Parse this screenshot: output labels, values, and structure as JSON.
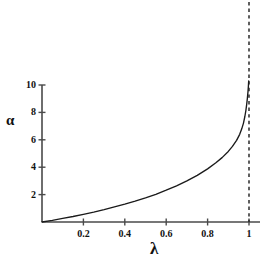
{
  "chart_data": {
    "type": "line",
    "title": "",
    "subtitle": "",
    "xlabel": "λ",
    "ylabel": "α",
    "xlim": [
      0,
      1.06
    ],
    "ylim": [
      0,
      10.8
    ],
    "grid": false,
    "legend": null,
    "x_ticks": [
      {
        "value": 0.2,
        "label": "0.2"
      },
      {
        "value": 0.4,
        "label": "0.4"
      },
      {
        "value": 0.6,
        "label": "0.6"
      },
      {
        "value": 0.8,
        "label": "0.8"
      },
      {
        "value": 1.0,
        "label": "1"
      }
    ],
    "y_ticks": [
      {
        "value": 2,
        "label": "2"
      },
      {
        "value": 4,
        "label": "4"
      },
      {
        "value": 6,
        "label": "6"
      },
      {
        "value": 8,
        "label": "8"
      },
      {
        "value": 10,
        "label": "10"
      }
    ],
    "annotations": [
      {
        "name": "vertical-asymptote",
        "type": "vline",
        "x": 1.0,
        "style": "dashed",
        "label": ""
      }
    ],
    "series": [
      {
        "name": "alpha-curve",
        "style": "solid",
        "color": "#1a1a1a",
        "x": [
          0.0,
          0.05,
          0.1,
          0.15,
          0.2,
          0.25,
          0.3,
          0.35,
          0.4,
          0.45,
          0.5,
          0.55,
          0.6,
          0.65,
          0.7,
          0.75,
          0.8,
          0.84,
          0.87,
          0.9,
          0.92,
          0.94,
          0.955,
          0.965,
          0.973,
          0.98,
          0.985,
          0.989,
          0.992,
          0.995,
          0.997,
          0.9985
        ],
        "y": [
          0.0,
          0.12,
          0.26,
          0.4,
          0.56,
          0.72,
          0.9,
          1.1,
          1.3,
          1.52,
          1.76,
          2.02,
          2.32,
          2.64,
          3.0,
          3.4,
          3.88,
          4.32,
          4.7,
          5.15,
          5.52,
          5.96,
          6.4,
          6.8,
          7.2,
          7.7,
          8.15,
          8.6,
          9.0,
          9.5,
          9.9,
          10.3
        ]
      }
    ]
  },
  "figure": {
    "axis_color": "#4a4a4a",
    "curve_color": "#1a1a1a",
    "asymptote_color": "#2a2a2a",
    "background": "#ffffff"
  }
}
